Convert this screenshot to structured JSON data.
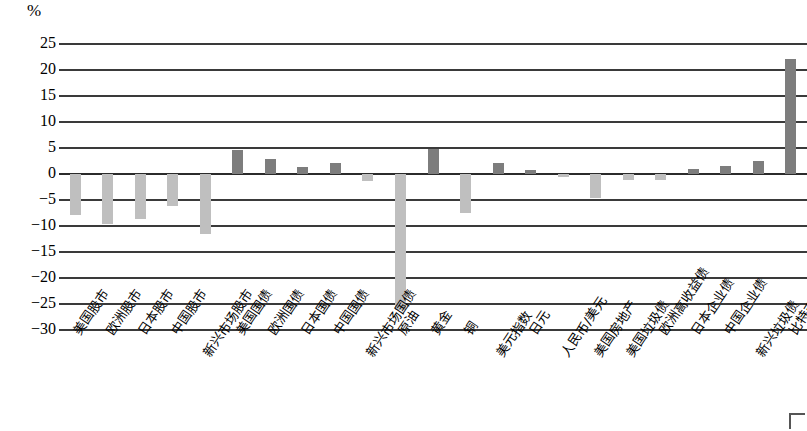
{
  "chart_data": {
    "type": "bar",
    "title": "",
    "subtitle": "",
    "xlabel": "",
    "ylabel": "%",
    "unit_label": "%",
    "ylim": [
      -30,
      25
    ],
    "ytick_step": 5,
    "yticks": [
      "25",
      "20",
      "15",
      "10",
      "5",
      "0",
      "−5",
      "−10",
      "−15",
      "−20",
      "−25",
      "−30"
    ],
    "ytick_values": [
      25,
      20,
      15,
      10,
      5,
      0,
      -5,
      -10,
      -15,
      -20,
      -25,
      -30
    ],
    "grid": true,
    "legend": "none",
    "colors": {
      "positive_bar": "#7d7d7d",
      "negative_bar": "#bfbfbf",
      "gridline": "#3a3a3a",
      "text": "#000000",
      "background": "#ffffff"
    },
    "categories": [
      "美国股市",
      "欧洲股市",
      "日本股市",
      "中国股市",
      "新兴市场股市",
      "美国国债",
      "欧洲国债",
      "日本国债",
      "中国国债",
      "新兴市场国债",
      "原油",
      "黄金",
      "铜",
      "美元指数",
      "日元",
      "人民币/美元",
      "美国房地产",
      "美国垃圾债",
      "欧洲高收益债",
      "日本企业债",
      "中国企业债",
      "新兴垃圾债",
      "比特币"
    ],
    "values": [
      -7.8,
      -9.6,
      -8.6,
      -6.2,
      -11.6,
      4.6,
      2.8,
      1.3,
      2.2,
      -1.3,
      -26.2,
      4.8,
      -7.5,
      2.2,
      0.7,
      -0.6,
      -4.6,
      -1.1,
      -1.2,
      1.0,
      1.5,
      2.5,
      22.2
    ],
    "label_wrap_low": [
      4,
      9,
      13,
      15,
      16,
      17,
      21
    ]
  }
}
